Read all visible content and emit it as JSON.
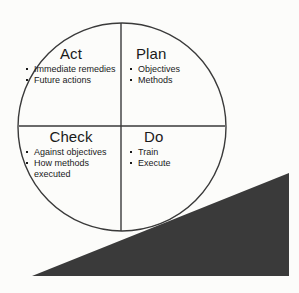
{
  "figure": {
    "name": "PDCA cycle diagram",
    "colors": {
      "background": "#fcfcfa",
      "stroke": "#3a3a3a",
      "text": "#1a1a1a",
      "ramp_fill": "#3a3a3a"
    },
    "circle": {
      "center_x": 122,
      "center_y": 127,
      "radius": 104,
      "stroke_width": 1.4
    },
    "divider_vertical": {
      "x": 121,
      "y1": 23,
      "y2": 231
    },
    "divider_horizontal": {
      "y": 126,
      "x1": 19,
      "x2": 225
    },
    "ramp": {
      "points": "32,276 289,173 289,276",
      "label": "ascending ramp"
    }
  },
  "quadrants": [
    {
      "id": "act",
      "title": "Act",
      "items": [
        "Immediate remedies",
        "Future actions"
      ]
    },
    {
      "id": "plan",
      "title": "Plan",
      "items": [
        "Objectives",
        "Methods"
      ]
    },
    {
      "id": "check",
      "title": "Check",
      "items": [
        "Against objectives",
        "How methods executed"
      ]
    },
    {
      "id": "do",
      "title": "Do",
      "items": [
        "Train",
        "Execute"
      ]
    }
  ]
}
